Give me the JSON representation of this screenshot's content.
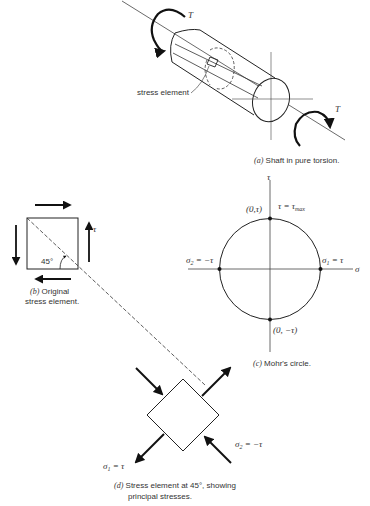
{
  "panel_a": {
    "torque_top": "T",
    "torque_bottom": "T",
    "element_label": "stress element",
    "caption_letter": "(a)",
    "caption_text": " Shaft in pure torsion."
  },
  "panel_b": {
    "tau_label": "τ",
    "angle_label": "45°",
    "caption_letter": "(b)",
    "caption_line1": " Original",
    "caption_line2": "stress element."
  },
  "panel_c": {
    "tau_axis": "τ",
    "sigma_axis": "σ",
    "top_point": "(0,τ)",
    "bottom_point": "(0, −τ)",
    "tau_max_label": "τ = τ",
    "tau_max_sub": "max",
    "sigma2_label": "σ",
    "sigma2_sub": "2",
    "sigma2_value": " = −τ",
    "sigma1_label": "σ",
    "sigma1_sub": "1",
    "sigma1_value": " = τ",
    "caption_letter": "(c)",
    "caption_text": " Mohr's circle."
  },
  "panel_d": {
    "sigma1_label": "σ",
    "sigma1_sub": "1",
    "sigma1_value": " = τ",
    "sigma2_label": "σ",
    "sigma2_sub": "2",
    "sigma2_value": " = −τ",
    "caption_letter": "(d)",
    "caption_line1": " Stress element at 45°, showing",
    "caption_line2": "principal stresses."
  }
}
